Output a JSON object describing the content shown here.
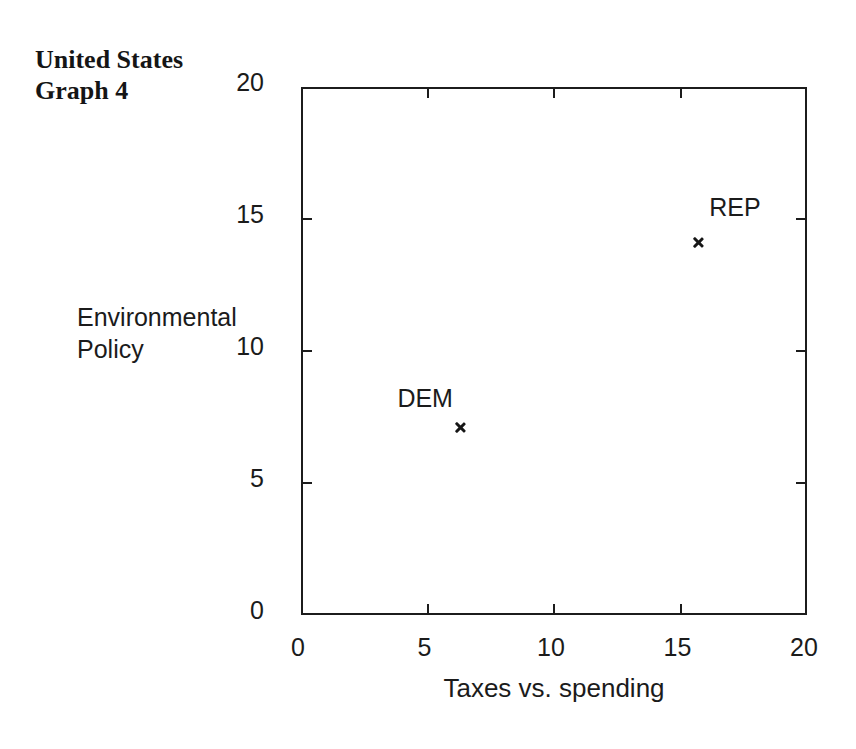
{
  "page": {
    "background_color": "#ffffff",
    "ink_color": "#1b1b1b"
  },
  "header": {
    "title_line1": "United States",
    "title_line2": "Graph 4"
  },
  "chart_data": {
    "type": "scatter",
    "title": "United States Graph 4",
    "xlabel": "Taxes vs. spending",
    "ylabel_line1": "Environmental",
    "ylabel_line2": "Policy",
    "xlim": [
      0,
      20
    ],
    "ylim": [
      0,
      20
    ],
    "xticks": [
      0,
      5,
      10,
      15,
      20
    ],
    "yticks": [
      0,
      5,
      10,
      15,
      20
    ],
    "grid": false,
    "legend": "none",
    "marker": "x",
    "points": [
      {
        "label": "DEM",
        "x": 6.3,
        "y": 7.1,
        "label_dx": -63,
        "label_dy": -44
      },
      {
        "label": "REP",
        "x": 15.7,
        "y": 14.1,
        "label_dx": 11,
        "label_dy": -50
      }
    ]
  }
}
